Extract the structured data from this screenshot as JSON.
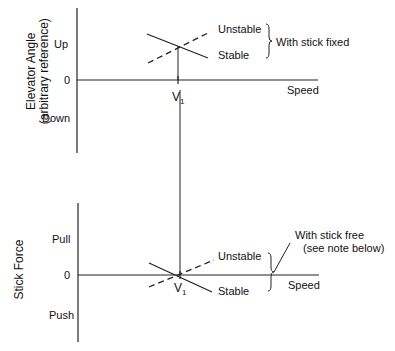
{
  "top_panel": {
    "y_axis_title_line1": "Elevator Angle",
    "y_axis_title_line2": "(arbitrary reference)",
    "tick_up": "Up",
    "tick_zero": "0",
    "tick_down": "Down",
    "x_axis_label": "Speed",
    "v_label": "V",
    "v_sub": "1",
    "unstable_label": "Unstable",
    "stable_label": "Stable",
    "group_label": "With stick fixed"
  },
  "bottom_panel": {
    "y_axis_title": "Stick Force",
    "tick_pull": "Pull",
    "tick_zero": "0",
    "tick_push": "Push",
    "x_axis_label": "Speed",
    "v_label": "V",
    "v_sub": "1",
    "unstable_label": "Unstable",
    "stable_label": "Stable",
    "group_label_line1": "With stick free",
    "group_label_line2": "(see note below)"
  }
}
